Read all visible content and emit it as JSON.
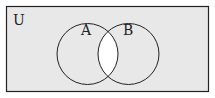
{
  "diagram": {
    "type": "venn",
    "universe_label": "U",
    "sets": [
      {
        "label": "A",
        "cx": 87.5,
        "cy": 54,
        "r": 30.5
      },
      {
        "label": "B",
        "cx": 128.5,
        "cy": 54,
        "r": 30.5
      }
    ],
    "shaded_region": "complement of A ∩ B (everything except the intersection)",
    "colors": {
      "shaded": "#e8e8e8",
      "unshaded": "#ffffff",
      "stroke": "#222222"
    }
  }
}
